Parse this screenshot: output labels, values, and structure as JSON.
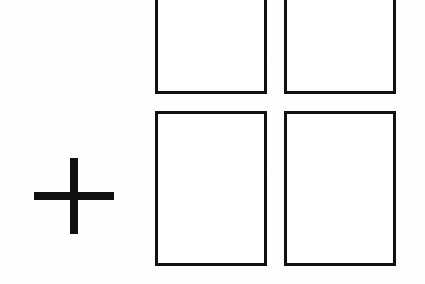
{
  "figure": {
    "canvas": {
      "width": 425,
      "height": 284
    },
    "background_color": "#fefefe",
    "ink_color": "#111111"
  },
  "plus_sign": {
    "name": "plus-sign",
    "symbol": "+",
    "color": "#111111",
    "center_x": 74,
    "center_y": 196,
    "arm_span_width": 80,
    "arm_span_height": 76,
    "stroke_thickness": 8,
    "left": 34,
    "top": 158,
    "width": 80,
    "height": 76
  },
  "rectangles": [
    {
      "id": "rect-top-left",
      "label": "top-left-rectangle",
      "row": "top",
      "column": "left",
      "left": 155,
      "top": -16,
      "width": 112,
      "height": 110,
      "border_width": 3,
      "border_color": "#111111",
      "fill_color": "#ffffff",
      "clipped_at_top": true,
      "content": ""
    },
    {
      "id": "rect-top-right",
      "label": "top-right-rectangle",
      "row": "top",
      "column": "right",
      "left": 284,
      "top": -16,
      "width": 112,
      "height": 110,
      "border_width": 3,
      "border_color": "#111111",
      "fill_color": "#ffffff",
      "clipped_at_top": true,
      "content": ""
    },
    {
      "id": "rect-bottom-left",
      "label": "bottom-left-rectangle",
      "row": "bottom",
      "column": "left",
      "left": 155,
      "top": 111,
      "width": 112,
      "height": 155,
      "border_width": 3,
      "border_color": "#111111",
      "fill_color": "#ffffff",
      "clipped_at_top": false,
      "content": ""
    },
    {
      "id": "rect-bottom-right",
      "label": "bottom-right-rectangle",
      "row": "bottom",
      "column": "right",
      "left": 284,
      "top": 111,
      "width": 112,
      "height": 155,
      "border_width": 3,
      "border_color": "#111111",
      "fill_color": "#ffffff",
      "clipped_at_top": false,
      "content": ""
    }
  ]
}
